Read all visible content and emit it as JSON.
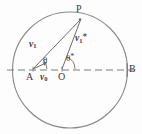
{
  "figure": {
    "type": "physics-scattering-diagram",
    "stroke_color": "#808080",
    "line_color": "#6e6e6e",
    "text_color": "#3b3b3b",
    "background_color": "#fdfdfd"
  },
  "geometry": {
    "circle": {
      "cx": 70,
      "cy": 70,
      "rx": 57,
      "ry": 58
    },
    "baseline": {
      "x1": 8,
      "y1": 70,
      "x2": 134,
      "y2": 70,
      "style": "dashed"
    },
    "points": {
      "A": {
        "x": 33,
        "y": 69
      },
      "O": {
        "x": 62,
        "y": 69
      },
      "P": {
        "x": 80,
        "y": 19
      },
      "B": {
        "x": 127,
        "y": 70
      }
    },
    "segments": [
      {
        "name": "A-to-P",
        "from": "A",
        "to": "P"
      },
      {
        "name": "O-to-P",
        "from": "O",
        "to": "P"
      },
      {
        "name": "v0-arrow",
        "from": [
          33,
          69
        ],
        "to": [
          46,
          62
        ]
      }
    ],
    "angles": [
      {
        "name": "theta",
        "vertex": "A",
        "value_label": "θ"
      },
      {
        "name": "theta-star",
        "vertex": "O",
        "value_label": "θ*"
      }
    ]
  },
  "labels": {
    "point_P": "P",
    "point_B": "B",
    "point_A": "A",
    "point_O": "O",
    "vector_v1_base": "v",
    "vector_v1_sub": "1",
    "vector_v1star_base": "v",
    "vector_v1star_sub": "1",
    "vector_v1star_sup": "*",
    "vector_v0_base": "v",
    "vector_v0_sub": "0",
    "angle_theta": "θ",
    "angle_theta_star_base": "θ",
    "angle_theta_star_sup": "*"
  }
}
